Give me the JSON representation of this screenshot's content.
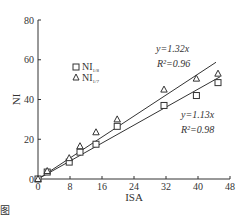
{
  "chart_data": {
    "type": "scatter",
    "title": "",
    "xlabel": "ISA",
    "ylabel": "NI",
    "xlim": [
      0,
      48
    ],
    "ylim": [
      0,
      80
    ],
    "xticks": [
      0,
      8,
      16,
      24,
      32,
      40,
      48
    ],
    "yticks": [
      0,
      20,
      40,
      60,
      80
    ],
    "grid": false,
    "legend_position": "upper-left",
    "series": [
      {
        "name": "NI_1/8",
        "marker": "square",
        "x": [
          0,
          2.3,
          7.8,
          10.5,
          14.5,
          19.8,
          31.5,
          39.6,
          45
        ],
        "y": [
          0,
          3.5,
          8.5,
          13.5,
          17.5,
          26.5,
          37,
          42,
          48.5
        ],
        "fit": {
          "slope": 1.13,
          "r2": 0.98,
          "label": "y=1.13x",
          "r2_label": "R²=0.98"
        }
      },
      {
        "name": "NI_1/7",
        "marker": "triangle",
        "x": [
          0,
          2.3,
          7.8,
          10.5,
          14.5,
          19.8,
          31.5,
          39.6,
          45
        ],
        "y": [
          0,
          4,
          10.5,
          16.5,
          23.5,
          30,
          45,
          50.5,
          53
        ],
        "fit": {
          "slope": 1.32,
          "r2": 0.96,
          "label": "y=1.32x",
          "r2_label": "R²=0.96"
        }
      }
    ]
  },
  "legend": {
    "items": [
      {
        "symbol": "□",
        "label": "NI",
        "sub": "1/8"
      },
      {
        "symbol": "△",
        "label": "NI",
        "sub": "1/7"
      }
    ]
  },
  "annotations": {
    "upper_eq": "y=1.32x",
    "upper_r2": "R²=0.96",
    "lower_eq": "y=1.13x",
    "lower_r2": "R²=0.98"
  },
  "footer_fragment": "图"
}
